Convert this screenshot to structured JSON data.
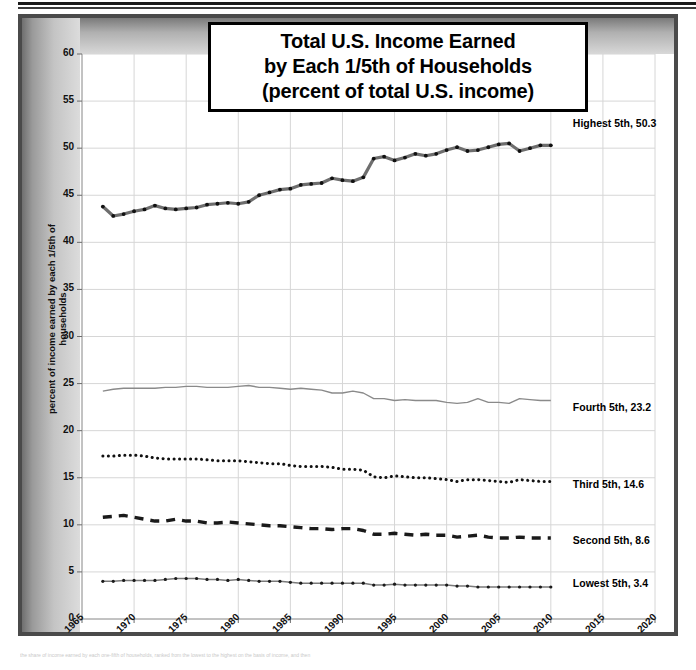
{
  "figure": {
    "title_lines": [
      "Total U.S. Income Earned",
      "by Each 1/5th of Households",
      "(percent of total U.S. income)"
    ],
    "footer_note": "the share of income earned by each one-fifth of households, ranked from the lowest to the highest on the basis of income, and then"
  },
  "chart_data": {
    "type": "line",
    "title": "Total U.S. Income Earned by Each 1/5th of Households (percent of total U.S. income)",
    "xlabel": "",
    "ylabel": "percent of income earned by each 1/5th of households",
    "xlim": [
      1965,
      2020
    ],
    "ylim": [
      0,
      60
    ],
    "xticks": [
      1965,
      1970,
      1975,
      1980,
      1985,
      1990,
      1995,
      2000,
      2005,
      2010,
      2015,
      2020
    ],
    "yticks": [
      0,
      5,
      10,
      15,
      20,
      25,
      30,
      35,
      40,
      45,
      50,
      55,
      60
    ],
    "grid": true,
    "legend": "inline-right-end-labels",
    "x": [
      1967,
      1968,
      1969,
      1970,
      1971,
      1972,
      1973,
      1974,
      1975,
      1976,
      1977,
      1978,
      1979,
      1980,
      1981,
      1982,
      1983,
      1984,
      1985,
      1986,
      1987,
      1988,
      1989,
      1990,
      1991,
      1992,
      1993,
      1994,
      1995,
      1996,
      1997,
      1998,
      1999,
      2000,
      2001,
      2002,
      2003,
      2004,
      2005,
      2006,
      2007,
      2008,
      2009,
      2010
    ],
    "series": [
      {
        "name": "Highest 5th",
        "end_label": "Highest 5th, 50.3",
        "end_value": 50.3,
        "style": "thick-gray-line-with-dots",
        "color": "#6e6e6e",
        "marker_color": "#111111",
        "values": [
          43.8,
          42.8,
          43.0,
          43.3,
          43.5,
          43.9,
          43.6,
          43.5,
          43.6,
          43.7,
          44.0,
          44.1,
          44.2,
          44.1,
          44.3,
          45.0,
          45.3,
          45.6,
          45.7,
          46.1,
          46.2,
          46.3,
          46.8,
          46.6,
          46.5,
          46.9,
          48.9,
          49.1,
          48.7,
          49.0,
          49.4,
          49.2,
          49.4,
          49.8,
          50.1,
          49.7,
          49.8,
          50.1,
          50.4,
          50.5,
          49.7,
          50.0,
          50.3,
          50.3
        ]
      },
      {
        "name": "Fourth 5th",
        "end_label": "Fourth 5th, 23.2",
        "end_value": 23.2,
        "style": "thin-gray-line",
        "color": "#8a8a8a",
        "marker_color": "#8a8a8a",
        "values": [
          24.2,
          24.4,
          24.5,
          24.5,
          24.5,
          24.5,
          24.6,
          24.6,
          24.7,
          24.7,
          24.6,
          24.6,
          24.6,
          24.7,
          24.8,
          24.6,
          24.6,
          24.5,
          24.4,
          24.5,
          24.4,
          24.3,
          24.0,
          24.0,
          24.2,
          24.0,
          23.4,
          23.4,
          23.2,
          23.3,
          23.2,
          23.2,
          23.2,
          23.0,
          22.9,
          23.0,
          23.4,
          23.0,
          23.0,
          22.9,
          23.4,
          23.3,
          23.2,
          23.2
        ]
      },
      {
        "name": "Third 5th",
        "end_label": "Third 5th, 14.6",
        "end_value": 14.6,
        "style": "dotted",
        "color": "#111111",
        "marker_color": "#111111",
        "values": [
          17.3,
          17.3,
          17.4,
          17.4,
          17.3,
          17.1,
          17.0,
          17.0,
          17.0,
          17.0,
          16.9,
          16.8,
          16.8,
          16.8,
          16.7,
          16.6,
          16.5,
          16.5,
          16.3,
          16.2,
          16.2,
          16.2,
          16.1,
          15.9,
          15.9,
          15.8,
          15.1,
          15.0,
          15.2,
          15.1,
          15.0,
          15.0,
          14.9,
          14.8,
          14.6,
          14.8,
          14.8,
          14.7,
          14.6,
          14.5,
          14.8,
          14.7,
          14.6,
          14.6
        ]
      },
      {
        "name": "Second 5th",
        "end_label": "Second 5th, 8.6",
        "end_value": 8.6,
        "style": "thick-dashed",
        "color": "#1a1a1a",
        "marker_color": "#1a1a1a",
        "values": [
          10.8,
          10.9,
          11.0,
          10.8,
          10.6,
          10.4,
          10.4,
          10.6,
          10.4,
          10.4,
          10.2,
          10.2,
          10.3,
          10.2,
          10.1,
          10.0,
          9.9,
          9.9,
          9.8,
          9.7,
          9.6,
          9.6,
          9.5,
          9.6,
          9.6,
          9.4,
          9.0,
          9.0,
          9.1,
          9.0,
          8.9,
          9.0,
          8.9,
          8.9,
          8.7,
          8.8,
          8.9,
          8.7,
          8.6,
          8.6,
          8.7,
          8.6,
          8.6,
          8.6
        ]
      },
      {
        "name": "Lowest 5th",
        "end_label": "Lowest 5th, 3.4",
        "end_value": 3.4,
        "style": "thin-gray-line-with-dots",
        "color": "#7a7a7a",
        "marker_color": "#1a1a1a",
        "values": [
          4.0,
          4.0,
          4.1,
          4.1,
          4.1,
          4.1,
          4.2,
          4.3,
          4.3,
          4.3,
          4.2,
          4.2,
          4.1,
          4.2,
          4.1,
          4.0,
          4.0,
          4.0,
          3.9,
          3.8,
          3.8,
          3.8,
          3.8,
          3.8,
          3.8,
          3.8,
          3.6,
          3.6,
          3.7,
          3.6,
          3.6,
          3.6,
          3.6,
          3.6,
          3.5,
          3.5,
          3.4,
          3.4,
          3.4,
          3.4,
          3.4,
          3.4,
          3.4,
          3.4
        ]
      }
    ]
  }
}
